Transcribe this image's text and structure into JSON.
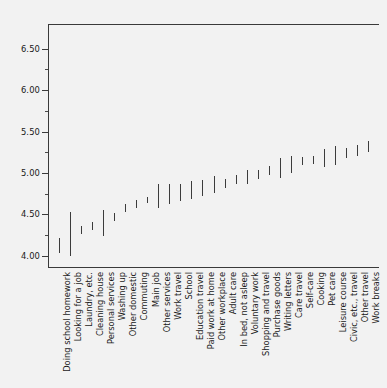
{
  "chart_data": {
    "type": "bar",
    "subtype": "error-bar-interval",
    "title": "",
    "subtitle": "",
    "xlabel": "",
    "ylabel": "",
    "ylim": [
      3.85,
      6.8
    ],
    "yticks": [
      4.0,
      4.5,
      5.0,
      5.5,
      6.0,
      6.5
    ],
    "ytick_labels": [
      "4.00",
      "4.50",
      "5.00",
      "5.50",
      "6.00",
      "6.50"
    ],
    "minor_ticks": [
      4.25,
      4.75,
      5.25,
      5.75,
      6.25
    ],
    "grid": false,
    "legend": "none",
    "orientation": "vertical",
    "sorted": "ascending",
    "categories": [
      "Doing school homework",
      "Looking for a job",
      "Laundry, etc.",
      "Cleaning house",
      "Personal services",
      "Washing up",
      "Other domestic",
      "Commuting",
      "Main job",
      "Other services",
      "Work travel",
      "School",
      "Education travel",
      "Paid work at home",
      "Other workplace",
      "Adult care",
      "In bed, not asleep",
      "Voluntary work",
      "Shopping and travel",
      "Purchase goods",
      "Writing letters",
      "Care travel",
      "Self-care",
      "Cooking",
      "Pet care",
      "Leisure course",
      "Civic, etc., travel",
      "Other travel",
      "Work breaks"
    ],
    "values": [
      4.12,
      4.26,
      4.31,
      4.36,
      4.39,
      4.47,
      4.57,
      4.62,
      4.67,
      4.71,
      4.74,
      4.76,
      4.79,
      4.82,
      4.86,
      4.88,
      4.92,
      4.95,
      4.98,
      5.03,
      5.06,
      5.1,
      5.14,
      5.16,
      5.18,
      5.21,
      5.24,
      5.27,
      5.32
    ],
    "intervals": [
      {
        "category": "Doing school homework",
        "low": 4.03,
        "high": 4.21,
        "mean": 4.12
      },
      {
        "category": "Looking for a job",
        "low": 3.99,
        "high": 4.53,
        "mean": 4.26
      },
      {
        "category": "Laundry, etc.",
        "low": 4.26,
        "high": 4.36,
        "mean": 4.31
      },
      {
        "category": "Cleaning house",
        "low": 4.31,
        "high": 4.41,
        "mean": 4.36
      },
      {
        "category": "Personal services",
        "low": 4.24,
        "high": 4.55,
        "mean": 4.39
      },
      {
        "category": "Washing up",
        "low": 4.42,
        "high": 4.52,
        "mean": 4.47
      },
      {
        "category": "Other domestic",
        "low": 4.53,
        "high": 4.62,
        "mean": 4.57
      },
      {
        "category": "Commuting",
        "low": 4.58,
        "high": 4.67,
        "mean": 4.62
      },
      {
        "category": "Main job",
        "low": 4.63,
        "high": 4.71,
        "mean": 4.67
      },
      {
        "category": "Other services",
        "low": 4.57,
        "high": 4.86,
        "mean": 4.71
      },
      {
        "category": "Work travel",
        "low": 4.62,
        "high": 4.87,
        "mean": 4.74
      },
      {
        "category": "School",
        "low": 4.66,
        "high": 4.86,
        "mean": 4.76
      },
      {
        "category": "Education travel",
        "low": 4.68,
        "high": 4.9,
        "mean": 4.79
      },
      {
        "category": "Paid work at home",
        "low": 4.72,
        "high": 4.92,
        "mean": 4.82
      },
      {
        "category": "Other workplace",
        "low": 4.76,
        "high": 4.96,
        "mean": 4.86
      },
      {
        "category": "Adult care",
        "low": 4.82,
        "high": 4.93,
        "mean": 4.88
      },
      {
        "category": "In bed, not asleep",
        "low": 4.87,
        "high": 4.97,
        "mean": 4.92
      },
      {
        "category": "Voluntary work",
        "low": 4.86,
        "high": 5.04,
        "mean": 4.95
      },
      {
        "category": "Shopping and travel",
        "low": 4.93,
        "high": 5.03,
        "mean": 4.98
      },
      {
        "category": "Purchase goods",
        "low": 4.98,
        "high": 5.08,
        "mean": 5.03
      },
      {
        "category": "Writing letters",
        "low": 4.94,
        "high": 5.18,
        "mean": 5.06
      },
      {
        "category": "Care travel",
        "low": 5.0,
        "high": 5.2,
        "mean": 5.1
      },
      {
        "category": "Self-care",
        "low": 5.09,
        "high": 5.19,
        "mean": 5.14
      },
      {
        "category": "Cooking",
        "low": 5.11,
        "high": 5.21,
        "mean": 5.16
      },
      {
        "category": "Pet care",
        "low": 5.07,
        "high": 5.29,
        "mean": 5.18
      },
      {
        "category": "Leisure course",
        "low": 5.1,
        "high": 5.32,
        "mean": 5.21
      },
      {
        "category": "Civic, etc., travel",
        "low": 5.18,
        "high": 5.3,
        "mean": 5.24
      },
      {
        "category": "Other travel",
        "low": 5.2,
        "high": 5.34,
        "mean": 5.27
      },
      {
        "category": "Work breaks",
        "low": 5.25,
        "high": 5.39,
        "mean": 5.32
      }
    ],
    "colors": {
      "background": "#f2f2f2",
      "axis": "#3a3a3a",
      "bar": "#3c3c3c",
      "text": "#1a1a1a"
    }
  }
}
